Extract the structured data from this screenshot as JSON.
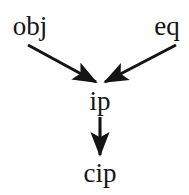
{
  "diagram": {
    "type": "directed-graph",
    "background_color": "#ffffff",
    "ink_color": "#141414",
    "width": 189,
    "height": 195,
    "nodes": [
      {
        "id": "obj",
        "label": "obj",
        "x": 30,
        "y": 27
      },
      {
        "id": "eq",
        "label": "eq",
        "x": 167,
        "y": 27
      },
      {
        "id": "ip",
        "label": "ip",
        "x": 100,
        "y": 102
      },
      {
        "id": "cip",
        "label": "cip",
        "x": 100,
        "y": 174
      }
    ],
    "edges": [
      {
        "id": "obj-to-ip",
        "from": "obj",
        "to": "ip",
        "label": "",
        "arrowhead": "filled-triangle",
        "x1": 28,
        "y1": 45,
        "x2": 96,
        "y2": 82
      },
      {
        "id": "eq-to-ip",
        "from": "eq",
        "to": "ip",
        "label": "",
        "arrowhead": "filled-triangle",
        "x1": 176,
        "y1": 45,
        "x2": 105,
        "y2": 82
      },
      {
        "id": "ip-to-cip",
        "from": "ip",
        "to": "cip",
        "label": "",
        "arrowhead": "filled-triangle",
        "x1": 100,
        "y1": 117,
        "x2": 100,
        "y2": 156
      }
    ]
  }
}
